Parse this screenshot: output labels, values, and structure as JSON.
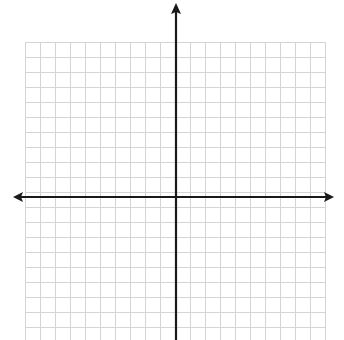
{
  "diagram": {
    "type": "coordinate-plane",
    "grid": {
      "left": 25,
      "top": 42,
      "right": 326,
      "bottom": 340,
      "cell_size": 15,
      "columns": 20,
      "rows": 20,
      "line_color": "#d4d4d4"
    },
    "x_axis": {
      "y": 197,
      "x_start": 13,
      "x_end": 334,
      "color": "#1a1a1a",
      "arrows": [
        "left",
        "right"
      ]
    },
    "y_axis": {
      "x": 176,
      "y_start": 3,
      "y_end": 340,
      "color": "#1a1a1a",
      "arrows": [
        "up"
      ]
    },
    "labels": []
  }
}
